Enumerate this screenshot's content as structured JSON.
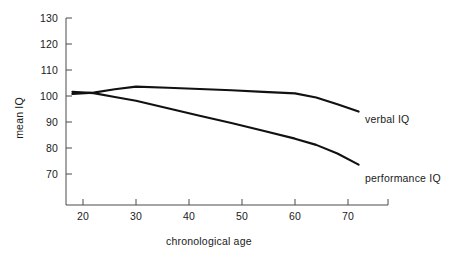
{
  "chart_data": {
    "type": "line",
    "title": "",
    "xlabel": "chronological age",
    "ylabel": "mean IQ",
    "xlim": [
      14,
      76
    ],
    "ylim": [
      62,
      133
    ],
    "xticks": [
      20,
      30,
      40,
      50,
      60,
      70
    ],
    "yticks": [
      70,
      80,
      90,
      100,
      110,
      120,
      130
    ],
    "xtick_labels": [
      "20",
      "30",
      "40",
      "50",
      "60",
      "70"
    ],
    "ytick_labels": [
      "70",
      "80",
      "90",
      "100",
      "110",
      "120",
      "130"
    ],
    "grid": false,
    "legend_position": "inline-right",
    "series": [
      {
        "name": "verbal IQ",
        "label": "verbal IQ",
        "color": "#111111",
        "x": [
          18,
          22,
          26,
          30,
          36,
          42,
          48,
          54,
          60,
          64,
          68,
          72
        ],
        "values": [
          100.8,
          101.3,
          102.6,
          103.6,
          103.2,
          102.7,
          102.2,
          101.6,
          101.0,
          99.4,
          96.8,
          94.0
        ]
      },
      {
        "name": "performance IQ",
        "label": "performance IQ",
        "color": "#111111",
        "x": [
          18,
          22,
          26,
          30,
          36,
          42,
          48,
          54,
          60,
          64,
          68,
          72
        ],
        "values": [
          101.6,
          101.1,
          99.6,
          98.2,
          95.3,
          92.4,
          89.6,
          86.6,
          83.6,
          81.2,
          77.9,
          73.6
        ]
      }
    ],
    "annotations": []
  },
  "axes": {
    "y_axis_name": "mean-iq-axis",
    "x_axis_name": "chronological-age-axis"
  }
}
